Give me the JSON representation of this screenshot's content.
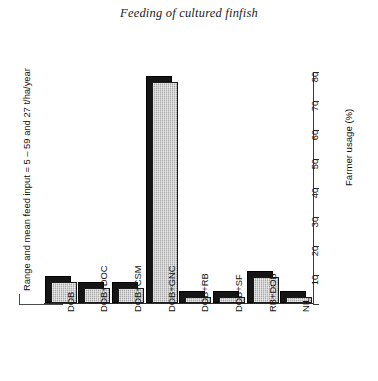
{
  "chart_data": {
    "type": "bar",
    "title": "Feeding of cultured finfish",
    "xlabel": "",
    "ylabel": "Farmer usage (%)",
    "ylim": [
      0,
      80
    ],
    "ytick_labels": [
      "0",
      "10",
      "20",
      "30",
      "40",
      "50",
      "60",
      "70",
      "80"
    ],
    "yticks": [
      0,
      10,
      20,
      30,
      40,
      50,
      60,
      70,
      80
    ],
    "grid": false,
    "legend": null,
    "categories": [
      "DOB",
      "DOB+DOC",
      "DOB+CSM",
      "DOB+GNC",
      "DOB+RB",
      "DOB+SF",
      "RB+DOB",
      "NIL"
    ],
    "values": [
      7,
      5,
      5,
      76,
      2,
      2,
      9,
      2
    ],
    "annotations": [
      "Range and mean feed input = 5 – 59 and 27 t/ha/year"
    ],
    "bar_style": "3d-block, black shadow with hatched grey face",
    "colors": {
      "bar_face": "#a9a9a9",
      "bar_shadow": "#151515",
      "axis": "#3a3a3a",
      "text": "#111111"
    }
  },
  "left_annotation": {
    "text": "Range and mean feed input = 5 – 59 and 27 t/ha/year"
  },
  "right_axis": {
    "title": "Farmer usage (%)"
  }
}
